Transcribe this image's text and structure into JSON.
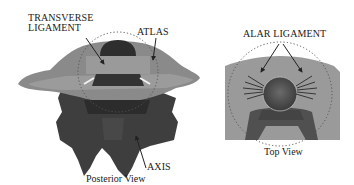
{
  "figure": {
    "panels": [
      {
        "id": "posterior",
        "caption": "Posterior View",
        "labels": {
          "transverse_ligament_line1": "TRANSVERSE",
          "transverse_ligament_line2": "LIGAMENT",
          "atlas": "ATLAS",
          "axis": "AXIS"
        }
      },
      {
        "id": "top",
        "caption": "Top View",
        "labels": {
          "alar_ligament": "ALAR LIGAMENT"
        }
      }
    ],
    "colors": {
      "atlas_fill": "#8a8a8a",
      "atlas_light": "#a6a6a6",
      "axis_fill": "#3e3e3e",
      "dens_fill": "#2e2e2e",
      "top_bg": "#9a9a9a",
      "dotted_circle": "#555555",
      "arrow": "#222222"
    }
  }
}
